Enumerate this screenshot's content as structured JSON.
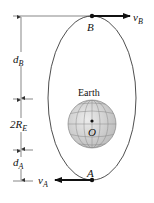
{
  "diagram": {
    "type": "orbit-ellipse",
    "colors": {
      "line": "#222222",
      "thin_line": "#555555",
      "globe_fill": "#d6d6d6",
      "globe_grid": "#8a8a8a",
      "background": "#ffffff"
    },
    "labels": {
      "point_b": "B",
      "point_a": "A",
      "velocity_b": "v",
      "velocity_b_sub": "B",
      "velocity_a": "v",
      "velocity_a_sub": "A",
      "earth": "Earth",
      "center": "O",
      "dim_db": "d",
      "dim_db_sub": "B",
      "dim_2re": "2R",
      "dim_2re_sub": "E",
      "dim_da": "d",
      "dim_da_sub": "A"
    }
  }
}
